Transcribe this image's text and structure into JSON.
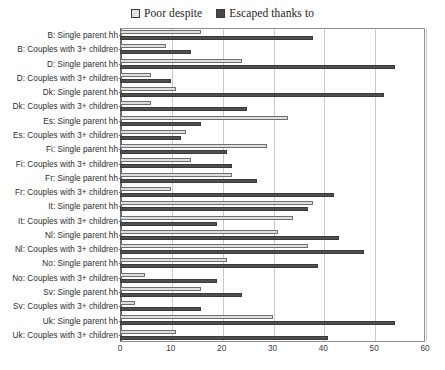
{
  "chart_data": {
    "type": "bar",
    "orientation": "horizontal",
    "title": "",
    "subtitle": "",
    "xlabel": "",
    "ylabel": "",
    "xlim": [
      0,
      60
    ],
    "xticks": [
      0,
      10,
      20,
      30,
      40,
      50,
      60
    ],
    "grid": true,
    "legend_position": "top-center",
    "legend": [
      "Poor despite",
      "Escaped thanks to"
    ],
    "colors": {
      "poor_despite": "#dedede",
      "escaped_thanks_to": "#4f4f4f",
      "gridline": "#c9c9c9",
      "axis": "#6d6d6d",
      "text": "#2b2b2b",
      "background": "#ffffff"
    },
    "categories": [
      "B: Single parent hh",
      "B: Couples with 3+ children",
      "D: Single parent hh",
      "D: Couples with 3+ children",
      "Dk: Single parent hh",
      "Dk: Couples with 3+ children",
      "Es: Single parent hh",
      "Es: Couples with 3+ children",
      "Fi: Single parent hh",
      "Fi: Couples with 3+ children",
      "Fr: Single parent hh",
      "Fr: Couples with 3+ children",
      "It: Single parent hh",
      "It: Couples with 3+ children",
      "Nl: Single parent hh",
      "Nl: Couples with 3+ children",
      "No: Single parent hh",
      "No: Couples with 3+ children",
      "Sv: Single parent hh",
      "Sv: Couples with 3+ children",
      "Uk: Single parent hh",
      "Uk: Couples with 3+ children"
    ],
    "series": [
      {
        "name": "Poor despite",
        "values": [
          16,
          9,
          24,
          6,
          11,
          6,
          33,
          13,
          29,
          14,
          22,
          10,
          38,
          34,
          31,
          37,
          21,
          5,
          16,
          3,
          30,
          11
        ]
      },
      {
        "name": "Escaped thanks to",
        "values": [
          38,
          14,
          54,
          10,
          52,
          25,
          16,
          12,
          21,
          22,
          27,
          42,
          37,
          19,
          43,
          48,
          39,
          19,
          24,
          16,
          54,
          41
        ]
      }
    ]
  }
}
